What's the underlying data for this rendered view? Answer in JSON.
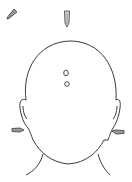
{
  "diagram": {
    "colors": {
      "background": "#ffffff",
      "line": "#3a3a3a",
      "marker_fill": "#9a9a9a"
    },
    "markers": [
      {
        "name": "top-left-marker",
        "shape": "angled tapered probe",
        "x": 12,
        "y": 14
      },
      {
        "name": "top-center-marker",
        "shape": "vertical tapered probe",
        "x": 67,
        "y": 18
      },
      {
        "name": "scalp-upper-dot",
        "shape": "small circle",
        "x": 66,
        "y": 74
      },
      {
        "name": "scalp-lower-dot",
        "shape": "small circle",
        "x": 67,
        "y": 84
      },
      {
        "name": "left-ear-marker",
        "shape": "horizontal tapered probe",
        "x": 16,
        "y": 130
      },
      {
        "name": "right-ear-marker",
        "shape": "horizontal tapered probe",
        "x": 120,
        "y": 131
      }
    ]
  }
}
